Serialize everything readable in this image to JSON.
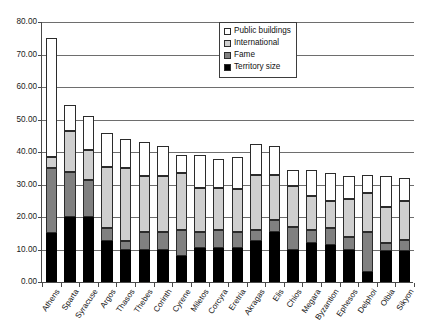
{
  "chart_data": {
    "type": "bar",
    "subtype": "stacked-vertical",
    "title": "",
    "subtitle": "",
    "xlabel": "",
    "ylabel": "",
    "ylim": [
      0,
      80
    ],
    "ytick_step": 10,
    "ytick_labels": [
      "0.00",
      "10.00",
      "20.00",
      "30.00",
      "40.00",
      "50.00",
      "60.00",
      "70.00",
      "80.00"
    ],
    "ytick_values": [
      0,
      10,
      20,
      30,
      40,
      50,
      60,
      70,
      80
    ],
    "grid": "horizontal",
    "legend_position": "top-right",
    "categories": [
      "Athens",
      "Sparta",
      "Syracuse",
      "Argos",
      "Thasos",
      "Thebes",
      "Corinth",
      "Cyrene",
      "Miletos",
      "Corcyra",
      "Eretria",
      "Akragas",
      "Elis",
      "Chios",
      "Megara",
      "Byzantion",
      "Ephesos",
      "Delphoi",
      "Olbia",
      "Sikyon"
    ],
    "series": [
      {
        "name": "Territory size",
        "color": "#000000",
        "values": [
          15.0,
          20.0,
          20.0,
          12.5,
          10.0,
          10.0,
          10.0,
          8.0,
          10.5,
          10.5,
          10.5,
          12.5,
          15.5,
          10.0,
          12.0,
          11.5,
          10.0,
          3.0,
          9.5,
          9.5
        ]
      },
      {
        "name": "Fame",
        "color": "#808080",
        "values": [
          20.0,
          14.0,
          11.5,
          4.0,
          2.5,
          5.5,
          5.5,
          8.0,
          5.0,
          5.5,
          5.0,
          3.5,
          3.5,
          7.0,
          4.0,
          5.0,
          4.0,
          12.5,
          2.5,
          3.5
        ]
      },
      {
        "name": "International",
        "color": "#cfcfcf",
        "values": [
          3.5,
          12.5,
          9.0,
          19.0,
          22.5,
          17.0,
          17.0,
          17.5,
          13.5,
          13.0,
          13.0,
          17.0,
          14.0,
          12.5,
          10.5,
          8.5,
          11.5,
          12.0,
          11.0,
          12.0
        ]
      },
      {
        "name": "Public buildings",
        "color": "#ffffff",
        "values": [
          36.5,
          8.0,
          10.5,
          10.5,
          9.0,
          10.5,
          9.5,
          5.5,
          10.0,
          9.0,
          10.0,
          9.5,
          9.0,
          5.0,
          8.0,
          8.5,
          7.0,
          5.5,
          9.5,
          7.0
        ]
      }
    ],
    "totals": [
      75.0,
      54.5,
      51.0,
      46.0,
      44.0,
      43.0,
      42.0,
      39.0,
      39.0,
      38.0,
      38.5,
      42.5,
      42.0,
      34.5,
      34.5,
      33.5,
      32.5,
      33.0,
      32.5,
      32.0
    ]
  },
  "legend": {
    "items": [
      {
        "label": "Public buildings",
        "swatch_class": "seg-public"
      },
      {
        "label": "International",
        "swatch_class": "seg-intl"
      },
      {
        "label": "Fame",
        "swatch_class": "seg-fame"
      },
      {
        "label": "Territory size",
        "swatch_class": "seg-territory"
      }
    ]
  }
}
